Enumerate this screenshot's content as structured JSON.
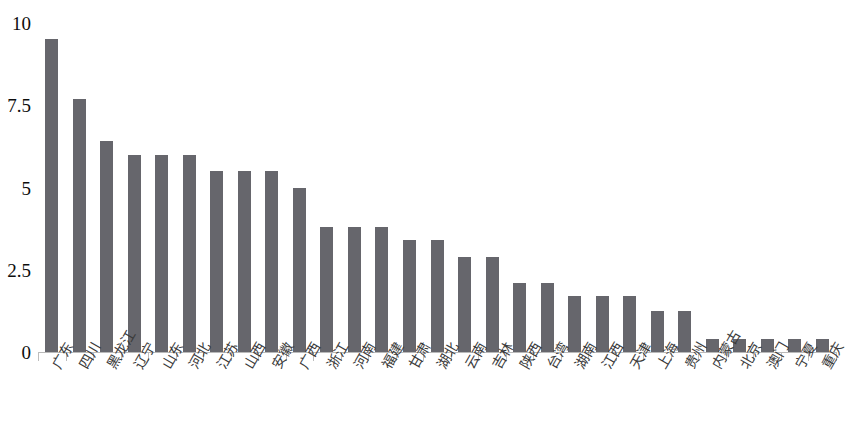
{
  "chart_data": {
    "type": "bar",
    "title": "",
    "subtitle": "",
    "xlabel": "",
    "ylabel": "",
    "ylim": [
      0,
      10
    ],
    "yticks": [
      "0",
      "2.5",
      "5",
      "7.5",
      "10"
    ],
    "ytick_values": [
      0,
      2.5,
      5,
      7.5,
      10
    ],
    "grid": false,
    "legend": null,
    "bar_color": "#66666c",
    "axis_color": "#bdbdbd",
    "categories": [
      "广东",
      "四川",
      "黑龙江",
      "辽宁",
      "山东",
      "河北",
      "江苏",
      "山西",
      "安徽",
      "广西",
      "浙江",
      "河南",
      "福建",
      "甘肃",
      "湖北",
      "云南",
      "吉林",
      "陕西",
      "台湾",
      "湖南",
      "江西",
      "天津",
      "上海",
      "贵州",
      "内蒙古",
      "北京",
      "澳门",
      "宁夏",
      "重庆"
    ],
    "values": [
      9.5,
      7.7,
      6.4,
      6.0,
      6.0,
      6.0,
      5.5,
      5.5,
      5.5,
      5.0,
      3.8,
      3.8,
      3.8,
      3.4,
      3.4,
      2.9,
      2.9,
      2.1,
      2.1,
      1.7,
      1.7,
      1.7,
      1.25,
      1.25,
      0.4,
      0.4,
      0.4,
      0.4,
      0.4
    ]
  }
}
